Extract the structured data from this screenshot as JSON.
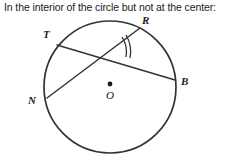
{
  "caption": "In the interior of the circle but not at the center:",
  "figure": {
    "name": "two-intersecting-chords-circle",
    "stroke_color": "#333333",
    "background_color": "#ffffff",
    "circle": {
      "center_label": "O",
      "center_x": 110,
      "center_y": 87,
      "radius": 66
    },
    "points": [
      {
        "id": "T",
        "label": "T",
        "x": 57,
        "y": 45,
        "label_x": 47,
        "label_y": 34
      },
      {
        "id": "R",
        "label": "R",
        "x": 140,
        "y": 28,
        "label_x": 145,
        "label_y": 20
      },
      {
        "id": "N",
        "label": "N",
        "x": 47,
        "y": 98,
        "label_x": 33,
        "label_y": 99
      },
      {
        "id": "B",
        "label": "B",
        "x": 175,
        "y": 80,
        "label_x": 185,
        "label_y": 81
      }
    ],
    "chords": [
      {
        "id": "TB",
        "from": "T",
        "to": "B"
      },
      {
        "id": "NR",
        "from": "N",
        "to": "R"
      }
    ],
    "intersection": {
      "x": 90,
      "y": 57
    },
    "angle_mark": {
      "type": "double-arc",
      "tick_count": 2
    }
  }
}
